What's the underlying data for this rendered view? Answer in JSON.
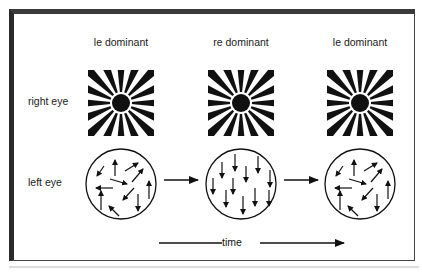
{
  "columns": [
    {
      "label": "le dominant",
      "x": 121
    },
    {
      "label": "re dominant",
      "x": 241
    },
    {
      "label": "le dominant",
      "x": 360
    }
  ],
  "rows": {
    "right_eye": {
      "label": "right eye",
      "stimulus": "radial-sunburst"
    },
    "left_eye": {
      "label": "left eye",
      "stimulus": "random-dot-motion"
    }
  },
  "left_eye_states": [
    "random motion",
    "coherent downward motion",
    "random motion"
  ],
  "time_axis": {
    "label": "time"
  },
  "colors": {
    "ink": "#111111",
    "frame": "#2a2a2a",
    "background": "#ffffff"
  }
}
